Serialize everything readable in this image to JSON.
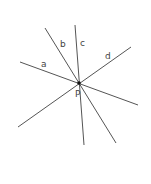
{
  "diagram": {
    "width": 151,
    "height": 184,
    "line_color": "#555555",
    "label_color": "#444444",
    "intersection": {
      "name": "P",
      "label": "P",
      "x": 79,
      "y": 83,
      "label_x": 75,
      "label_y": 97
    },
    "lines": [
      {
        "name": "a",
        "label": "a",
        "x1": 20,
        "y1": 62,
        "x2": 138,
        "y2": 105,
        "label_x": 41,
        "label_y": 67
      },
      {
        "name": "b",
        "label": "b",
        "x1": 45,
        "y1": 28,
        "x2": 116,
        "y2": 143,
        "label_x": 60,
        "label_y": 47
      },
      {
        "name": "c",
        "label": "c",
        "x1": 75,
        "y1": 25,
        "x2": 84,
        "y2": 145,
        "label_x": 80,
        "label_y": 46
      },
      {
        "name": "d",
        "label": "d",
        "x1": 131,
        "y1": 47,
        "x2": 18,
        "y2": 127,
        "label_x": 105,
        "label_y": 59
      }
    ]
  }
}
